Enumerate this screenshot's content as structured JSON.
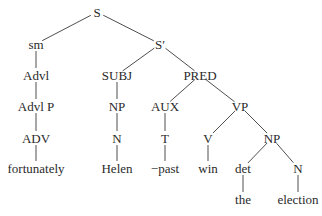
{
  "diagram": {
    "type": "syntax-tree",
    "nodes": [
      {
        "id": "S",
        "label": "S",
        "x": 97,
        "y": 12
      },
      {
        "id": "sm",
        "label": "sm",
        "x": 36,
        "y": 44
      },
      {
        "id": "Sbar",
        "label": "S′",
        "x": 160,
        "y": 44
      },
      {
        "id": "Advl",
        "label": "Advl",
        "x": 36,
        "y": 75
      },
      {
        "id": "SUBJ",
        "label": "SUBJ",
        "x": 117,
        "y": 75
      },
      {
        "id": "PRED",
        "label": "PRED",
        "x": 200,
        "y": 75
      },
      {
        "id": "AdvlP",
        "label": "Advl P",
        "x": 36,
        "y": 106
      },
      {
        "id": "NP1",
        "label": "NP",
        "x": 117,
        "y": 106
      },
      {
        "id": "AUX",
        "label": "AUX",
        "x": 165,
        "y": 106
      },
      {
        "id": "VP",
        "label": "VP",
        "x": 240,
        "y": 106
      },
      {
        "id": "ADV",
        "label": "ADV",
        "x": 36,
        "y": 138
      },
      {
        "id": "N1",
        "label": "N",
        "x": 117,
        "y": 138
      },
      {
        "id": "T",
        "label": "T",
        "x": 165,
        "y": 138
      },
      {
        "id": "V",
        "label": "V",
        "x": 208,
        "y": 138
      },
      {
        "id": "NP2",
        "label": "NP",
        "x": 272,
        "y": 138
      },
      {
        "id": "fortunately",
        "label": "fortunately",
        "x": 36,
        "y": 168
      },
      {
        "id": "Helen",
        "label": "Helen",
        "x": 117,
        "y": 168
      },
      {
        "id": "past",
        "label": "−past",
        "x": 165,
        "y": 168
      },
      {
        "id": "win",
        "label": "win",
        "x": 208,
        "y": 168
      },
      {
        "id": "det",
        "label": "det",
        "x": 243,
        "y": 168
      },
      {
        "id": "N2",
        "label": "N",
        "x": 298,
        "y": 168
      },
      {
        "id": "the",
        "label": "the",
        "x": 243,
        "y": 199
      },
      {
        "id": "election",
        "label": "election",
        "x": 298,
        "y": 199
      }
    ],
    "edges": [
      [
        "S",
        "sm"
      ],
      [
        "S",
        "Sbar"
      ],
      [
        "sm",
        "Advl"
      ],
      [
        "Advl",
        "AdvlP"
      ],
      [
        "AdvlP",
        "ADV"
      ],
      [
        "ADV",
        "fortunately"
      ],
      [
        "Sbar",
        "SUBJ"
      ],
      [
        "Sbar",
        "PRED"
      ],
      [
        "SUBJ",
        "NP1"
      ],
      [
        "NP1",
        "N1"
      ],
      [
        "N1",
        "Helen"
      ],
      [
        "PRED",
        "AUX"
      ],
      [
        "PRED",
        "VP"
      ],
      [
        "AUX",
        "T"
      ],
      [
        "T",
        "past"
      ],
      [
        "VP",
        "V"
      ],
      [
        "VP",
        "NP2"
      ],
      [
        "V",
        "win"
      ],
      [
        "NP2",
        "det"
      ],
      [
        "NP2",
        "N2"
      ],
      [
        "det",
        "the"
      ],
      [
        "N2",
        "election"
      ]
    ]
  }
}
